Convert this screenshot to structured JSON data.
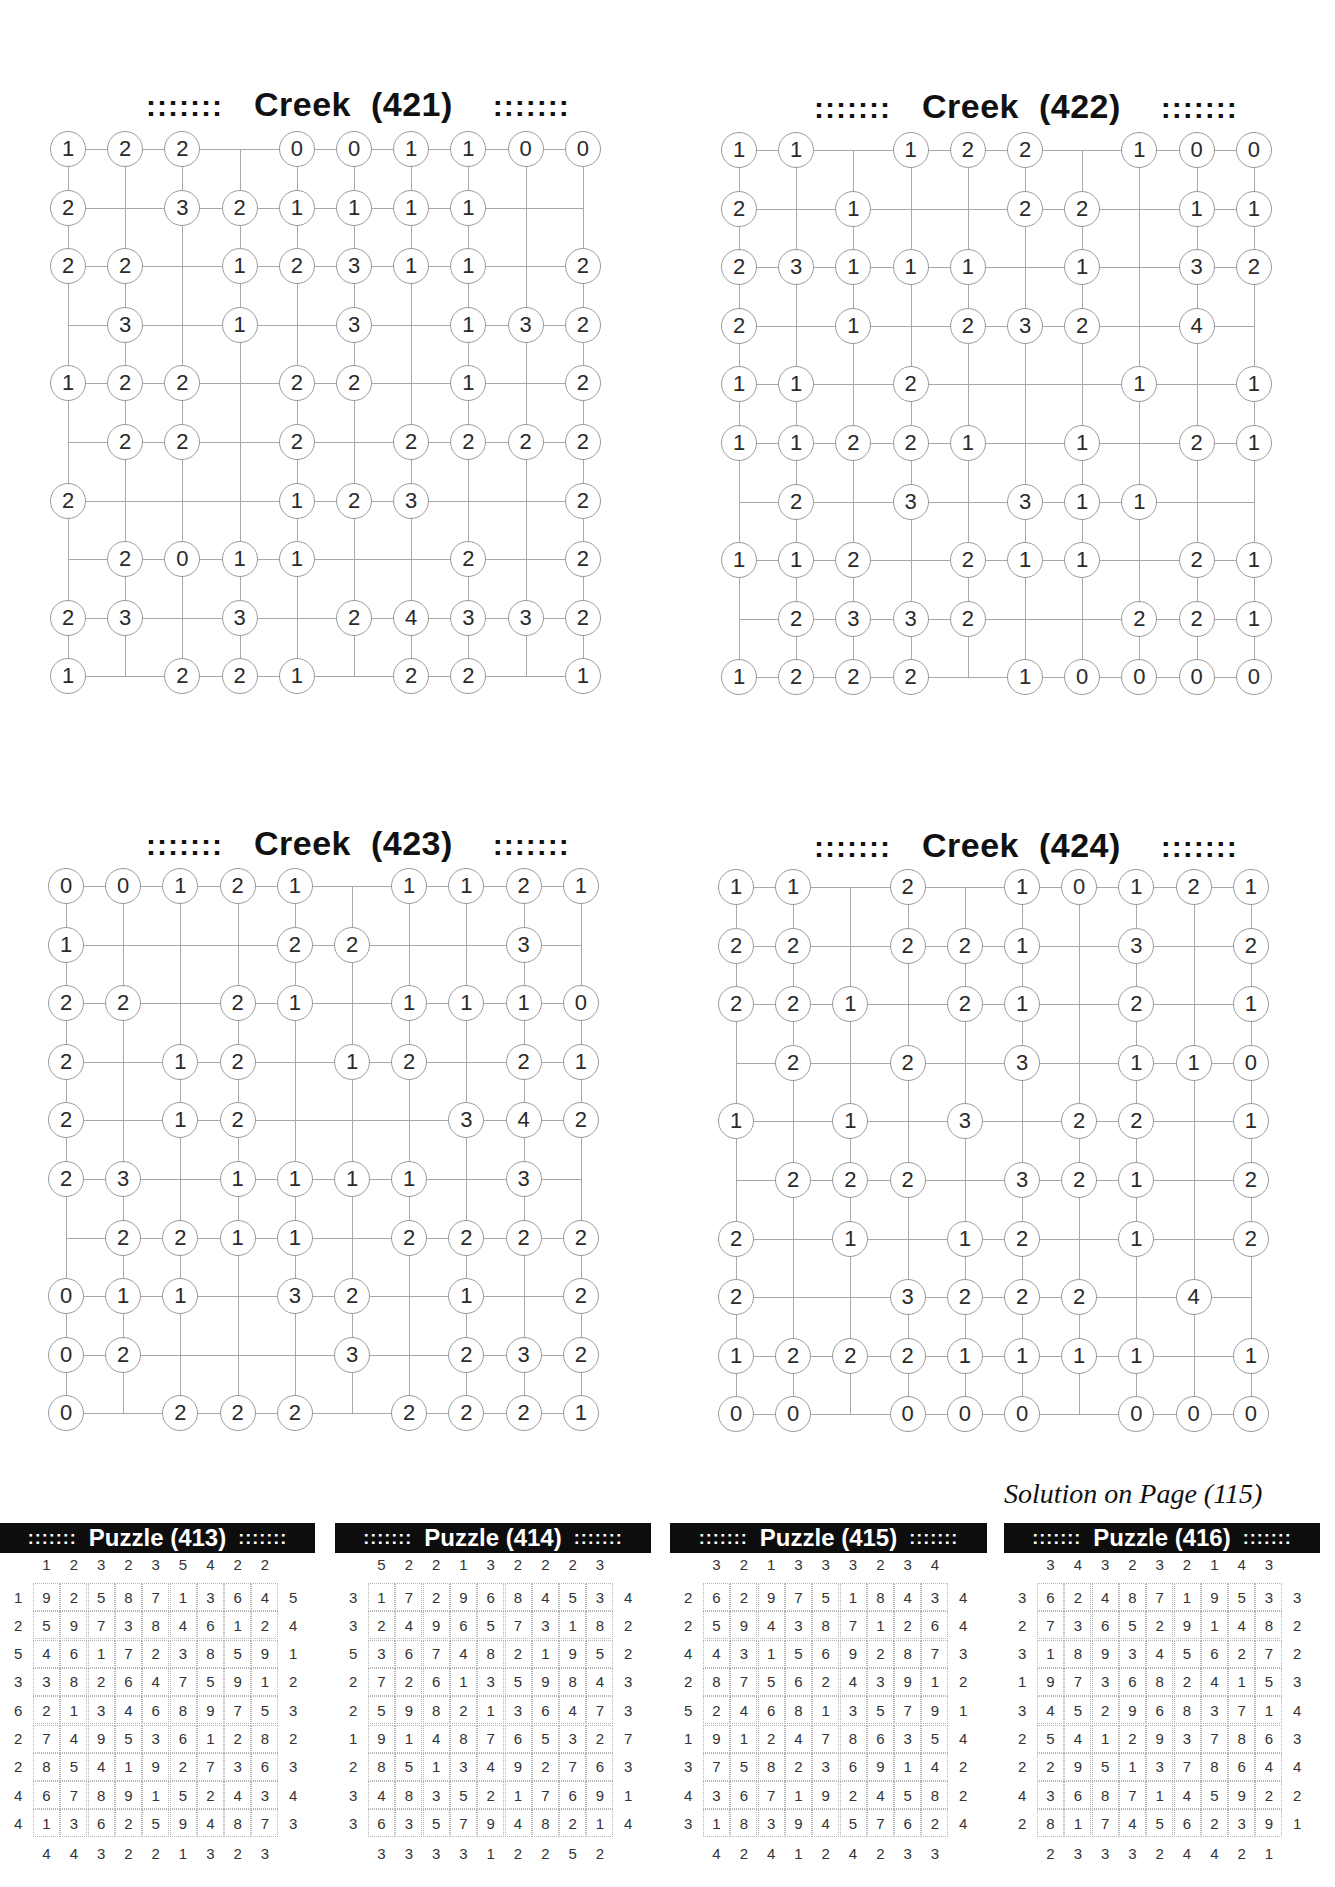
{
  "creek_puzzles": [
    {
      "id": "421",
      "title": "Creek  (421)",
      "dots": ":::::::",
      "rows": [
        [
          "1",
          "2",
          "2",
          "",
          "0",
          "0",
          "1",
          "1",
          "0",
          "0"
        ],
        [
          "2",
          "",
          "3",
          "2",
          "1",
          "1",
          "1",
          "1",
          "",
          ""
        ],
        [
          "2",
          "2",
          "",
          "1",
          "2",
          "3",
          "1",
          "1",
          "",
          "2"
        ],
        [
          "",
          "3",
          "",
          "1",
          "",
          "3",
          "",
          "1",
          "3",
          "2"
        ],
        [
          "1",
          "2",
          "2",
          "",
          "2",
          "2",
          "",
          "1",
          "",
          "2"
        ],
        [
          "",
          "2",
          "2",
          "",
          "2",
          "",
          "2",
          "2",
          "2",
          "2"
        ],
        [
          "2",
          "",
          "",
          "",
          "1",
          "2",
          "3",
          "",
          "",
          "2"
        ],
        [
          "",
          "2",
          "0",
          "1",
          "1",
          "",
          "",
          "2",
          "",
          "2"
        ],
        [
          "2",
          "3",
          "",
          "3",
          "",
          "2",
          "4",
          "3",
          "3",
          "2"
        ],
        [
          "1",
          "",
          "2",
          "2",
          "1",
          "",
          "2",
          "2",
          "",
          "1"
        ]
      ]
    },
    {
      "id": "422",
      "title": "Creek  (422)",
      "dots": ":::::::",
      "rows": [
        [
          "1",
          "1",
          "",
          "1",
          "2",
          "2",
          "",
          "1",
          "0",
          "0"
        ],
        [
          "2",
          "",
          "1",
          "",
          "",
          "2",
          "2",
          "",
          "1",
          "1"
        ],
        [
          "2",
          "3",
          "1",
          "1",
          "1",
          "",
          "1",
          "",
          "3",
          "2"
        ],
        [
          "2",
          "",
          "1",
          "",
          "2",
          "3",
          "2",
          "",
          "4",
          ""
        ],
        [
          "1",
          "1",
          "",
          "2",
          "",
          "",
          "",
          "1",
          "",
          "1"
        ],
        [
          "1",
          "1",
          "2",
          "2",
          "1",
          "",
          "1",
          "",
          "2",
          "1"
        ],
        [
          "",
          "2",
          "",
          "3",
          "",
          "3",
          "1",
          "1",
          "",
          ""
        ],
        [
          "1",
          "1",
          "2",
          "",
          "2",
          "1",
          "1",
          "",
          "2",
          "1"
        ],
        [
          "",
          "2",
          "3",
          "3",
          "2",
          "",
          "",
          "2",
          "2",
          "1"
        ],
        [
          "1",
          "2",
          "2",
          "2",
          "",
          "1",
          "0",
          "0",
          "0",
          "0"
        ]
      ]
    },
    {
      "id": "423",
      "title": "Creek  (423)",
      "dots": ":::::::",
      "rows": [
        [
          "0",
          "0",
          "1",
          "2",
          "1",
          "",
          "1",
          "1",
          "2",
          "1"
        ],
        [
          "1",
          "",
          "",
          "",
          "2",
          "2",
          "",
          "",
          "3",
          ""
        ],
        [
          "2",
          "2",
          "",
          "2",
          "1",
          "",
          "1",
          "1",
          "1",
          "0"
        ],
        [
          "2",
          "",
          "1",
          "2",
          "",
          "1",
          "2",
          "",
          "2",
          "1"
        ],
        [
          "2",
          "",
          "1",
          "2",
          "",
          "",
          "",
          "3",
          "4",
          "2"
        ],
        [
          "2",
          "3",
          "",
          "1",
          "1",
          "1",
          "1",
          "",
          "3",
          ""
        ],
        [
          "",
          "2",
          "2",
          "1",
          "1",
          "",
          "2",
          "2",
          "2",
          "2"
        ],
        [
          "0",
          "1",
          "1",
          "",
          "3",
          "2",
          "",
          "1",
          "",
          "2"
        ],
        [
          "0",
          "2",
          "",
          "",
          "",
          "3",
          "",
          "2",
          "3",
          "2"
        ],
        [
          "0",
          "",
          "2",
          "2",
          "2",
          "",
          "2",
          "2",
          "2",
          "1"
        ]
      ]
    },
    {
      "id": "424",
      "title": "Creek  (424)",
      "dots": ":::::::",
      "rows": [
        [
          "1",
          "1",
          "",
          "2",
          "",
          "1",
          "0",
          "1",
          "2",
          "1"
        ],
        [
          "2",
          "2",
          "",
          "2",
          "2",
          "1",
          "",
          "3",
          "",
          "2"
        ],
        [
          "2",
          "2",
          "1",
          "",
          "2",
          "1",
          "",
          "2",
          "",
          "1"
        ],
        [
          "",
          "2",
          "",
          "2",
          "",
          "3",
          "",
          "1",
          "1",
          "0"
        ],
        [
          "1",
          "",
          "1",
          "",
          "3",
          "",
          "2",
          "2",
          "",
          "1"
        ],
        [
          "",
          "2",
          "2",
          "2",
          "",
          "3",
          "2",
          "1",
          "",
          "2"
        ],
        [
          "2",
          "",
          "1",
          "",
          "1",
          "2",
          "",
          "1",
          "",
          "2"
        ],
        [
          "2",
          "",
          "",
          "3",
          "2",
          "2",
          "2",
          "",
          "4",
          ""
        ],
        [
          "1",
          "2",
          "2",
          "2",
          "1",
          "1",
          "1",
          "1",
          "",
          "1"
        ],
        [
          "0",
          "0",
          "",
          "0",
          "0",
          "0",
          "",
          "0",
          "0",
          "0"
        ]
      ]
    }
  ],
  "solution_note": "Solution on Page (115)",
  "solutions": [
    {
      "id": "413",
      "title": "Puzzle (413)",
      "dots": ":::::::",
      "top": [
        "1",
        "2",
        "3",
        "2",
        "3",
        "5",
        "4",
        "2",
        "2"
      ],
      "bottom": [
        "4",
        "4",
        "3",
        "2",
        "2",
        "1",
        "3",
        "2",
        "3"
      ],
      "left": [
        "1",
        "2",
        "5",
        "3",
        "6",
        "2",
        "2",
        "4",
        "4"
      ],
      "right": [
        "5",
        "4",
        "1",
        "2",
        "3",
        "2",
        "3",
        "4",
        "3"
      ],
      "cells": [
        [
          "9",
          "2",
          "5",
          "8",
          "7",
          "1",
          "3",
          "6",
          "4"
        ],
        [
          "5",
          "9",
          "7",
          "3",
          "8",
          "4",
          "6",
          "1",
          "2"
        ],
        [
          "4",
          "6",
          "1",
          "7",
          "2",
          "3",
          "8",
          "5",
          "9"
        ],
        [
          "3",
          "8",
          "2",
          "6",
          "4",
          "7",
          "5",
          "9",
          "1"
        ],
        [
          "2",
          "1",
          "3",
          "4",
          "6",
          "8",
          "9",
          "7",
          "5"
        ],
        [
          "7",
          "4",
          "9",
          "5",
          "3",
          "6",
          "1",
          "2",
          "8"
        ],
        [
          "8",
          "5",
          "4",
          "1",
          "9",
          "2",
          "7",
          "3",
          "6"
        ],
        [
          "6",
          "7",
          "8",
          "9",
          "1",
          "5",
          "2",
          "4",
          "3"
        ],
        [
          "1",
          "3",
          "6",
          "2",
          "5",
          "9",
          "4",
          "8",
          "7"
        ]
      ]
    },
    {
      "id": "414",
      "title": "Puzzle (414)",
      "dots": ":::::::",
      "top": [
        "5",
        "2",
        "2",
        "1",
        "3",
        "2",
        "2",
        "2",
        "3"
      ],
      "bottom": [
        "3",
        "3",
        "3",
        "3",
        "1",
        "2",
        "2",
        "5",
        "2"
      ],
      "left": [
        "3",
        "3",
        "5",
        "2",
        "2",
        "1",
        "2",
        "3",
        "3"
      ],
      "right": [
        "4",
        "2",
        "2",
        "3",
        "3",
        "7",
        "3",
        "1",
        "4"
      ],
      "cells": [
        [
          "1",
          "7",
          "2",
          "9",
          "6",
          "8",
          "4",
          "5",
          "3"
        ],
        [
          "2",
          "4",
          "9",
          "6",
          "5",
          "7",
          "3",
          "1",
          "8"
        ],
        [
          "3",
          "6",
          "7",
          "4",
          "8",
          "2",
          "1",
          "9",
          "5"
        ],
        [
          "7",
          "2",
          "6",
          "1",
          "3",
          "5",
          "9",
          "8",
          "4"
        ],
        [
          "5",
          "9",
          "8",
          "2",
          "1",
          "3",
          "6",
          "4",
          "7"
        ],
        [
          "9",
          "1",
          "4",
          "8",
          "7",
          "6",
          "5",
          "3",
          "2"
        ],
        [
          "8",
          "5",
          "1",
          "3",
          "4",
          "9",
          "2",
          "7",
          "6"
        ],
        [
          "4",
          "8",
          "3",
          "5",
          "2",
          "1",
          "7",
          "6",
          "9"
        ],
        [
          "6",
          "3",
          "5",
          "7",
          "9",
          "4",
          "8",
          "2",
          "1"
        ]
      ]
    },
    {
      "id": "415",
      "title": "Puzzle (415)",
      "dots": ":::::::",
      "top": [
        "3",
        "2",
        "1",
        "3",
        "3",
        "3",
        "2",
        "3",
        "4"
      ],
      "bottom": [
        "4",
        "2",
        "4",
        "1",
        "2",
        "4",
        "2",
        "3",
        "3"
      ],
      "left": [
        "2",
        "2",
        "4",
        "2",
        "5",
        "1",
        "3",
        "4",
        "3"
      ],
      "right": [
        "4",
        "4",
        "3",
        "2",
        "1",
        "4",
        "2",
        "2",
        "4"
      ],
      "cells": [
        [
          "6",
          "2",
          "9",
          "7",
          "5",
          "1",
          "8",
          "4",
          "3"
        ],
        [
          "5",
          "9",
          "4",
          "3",
          "8",
          "7",
          "1",
          "2",
          "6"
        ],
        [
          "4",
          "3",
          "1",
          "5",
          "6",
          "9",
          "2",
          "8",
          "7"
        ],
        [
          "8",
          "7",
          "5",
          "6",
          "2",
          "4",
          "3",
          "9",
          "1"
        ],
        [
          "2",
          "4",
          "6",
          "8",
          "1",
          "3",
          "5",
          "7",
          "9"
        ],
        [
          "9",
          "1",
          "2",
          "4",
          "7",
          "8",
          "6",
          "3",
          "5"
        ],
        [
          "7",
          "5",
          "8",
          "2",
          "3",
          "6",
          "9",
          "1",
          "4"
        ],
        [
          "3",
          "6",
          "7",
          "1",
          "9",
          "2",
          "4",
          "5",
          "8"
        ],
        [
          "1",
          "8",
          "3",
          "9",
          "4",
          "5",
          "7",
          "6",
          "2"
        ]
      ]
    },
    {
      "id": "416",
      "title": "Puzzle (416)",
      "dots": ":::::::",
      "top": [
        "3",
        "4",
        "3",
        "2",
        "3",
        "2",
        "1",
        "4",
        "3"
      ],
      "bottom": [
        "2",
        "3",
        "3",
        "3",
        "2",
        "4",
        "4",
        "2",
        "1"
      ],
      "left": [
        "3",
        "2",
        "3",
        "1",
        "3",
        "2",
        "2",
        "4",
        "2"
      ],
      "right": [
        "3",
        "2",
        "2",
        "3",
        "4",
        "3",
        "4",
        "2",
        "1"
      ],
      "cells": [
        [
          "6",
          "2",
          "4",
          "8",
          "7",
          "1",
          "9",
          "5",
          "3"
        ],
        [
          "7",
          "3",
          "6",
          "5",
          "2",
          "9",
          "1",
          "4",
          "8"
        ],
        [
          "1",
          "8",
          "9",
          "3",
          "4",
          "5",
          "6",
          "2",
          "7"
        ],
        [
          "9",
          "7",
          "3",
          "6",
          "8",
          "2",
          "4",
          "1",
          "5"
        ],
        [
          "4",
          "5",
          "2",
          "9",
          "6",
          "8",
          "3",
          "7",
          "1"
        ],
        [
          "5",
          "4",
          "1",
          "2",
          "9",
          "3",
          "7",
          "8",
          "6"
        ],
        [
          "2",
          "9",
          "5",
          "1",
          "3",
          "7",
          "8",
          "6",
          "4"
        ],
        [
          "3",
          "6",
          "8",
          "7",
          "1",
          "4",
          "5",
          "9",
          "2"
        ],
        [
          "8",
          "1",
          "7",
          "4",
          "5",
          "6",
          "2",
          "3",
          "9"
        ]
      ]
    }
  ]
}
